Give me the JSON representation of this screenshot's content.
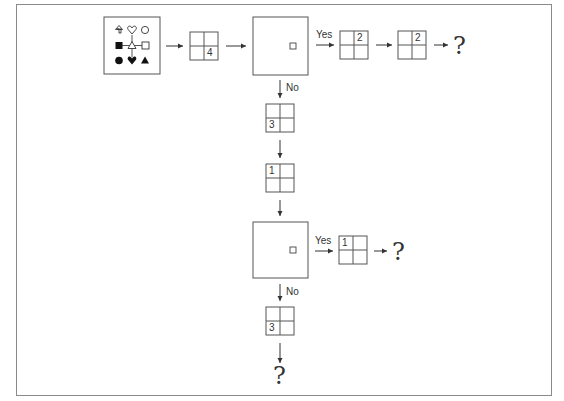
{
  "diagram": {
    "frame": {
      "x": 16,
      "y": 4,
      "w": 536,
      "h": 392
    },
    "colors": {
      "stroke": "#555555",
      "fill": "#111111",
      "frame": "#8a8a8a"
    },
    "legend_box": {
      "x": 104,
      "y": 17,
      "w": 56,
      "h": 57,
      "symbols": [
        {
          "name": "up-arrow-outline",
          "row": 0,
          "col": 0
        },
        {
          "name": "heart-outline",
          "row": 0,
          "col": 1
        },
        {
          "name": "circle-outline",
          "row": 0,
          "col": 2
        },
        {
          "name": "square-filled",
          "row": 1,
          "col": 0
        },
        {
          "name": "triangle-outline-center",
          "row": 1,
          "col": 1
        },
        {
          "name": "square-outline",
          "row": 1,
          "col": 2
        },
        {
          "name": "circle-filled",
          "row": 2,
          "col": 0
        },
        {
          "name": "heart-filled",
          "row": 2,
          "col": 1
        },
        {
          "name": "triangle-filled",
          "row": 2,
          "col": 2
        }
      ]
    },
    "big_boxes": [
      {
        "id": "decision-1",
        "x": 253,
        "y": 17,
        "w": 55,
        "h": 58
      },
      {
        "id": "decision-2",
        "x": 253,
        "y": 222,
        "w": 55,
        "h": 56
      }
    ],
    "grids": [
      {
        "id": "grid-a",
        "x": 190,
        "y": 32,
        "size": 28,
        "value": "4",
        "quadrant": "bottom-right"
      },
      {
        "id": "grid-b",
        "x": 340,
        "y": 31,
        "size": 28,
        "value": "2",
        "quadrant": "top-right"
      },
      {
        "id": "grid-c",
        "x": 398,
        "y": 31,
        "size": 28,
        "value": "2",
        "quadrant": "top-right"
      },
      {
        "id": "grid-d",
        "x": 266,
        "y": 104,
        "size": 28,
        "value": "3",
        "quadrant": "bottom-left"
      },
      {
        "id": "grid-e",
        "x": 266,
        "y": 164,
        "size": 28,
        "value": "1",
        "quadrant": "top-left"
      },
      {
        "id": "grid-f",
        "x": 339,
        "y": 236,
        "size": 28,
        "value": "1",
        "quadrant": "top-left"
      },
      {
        "id": "grid-g",
        "x": 266,
        "y": 307,
        "size": 28,
        "value": "3",
        "quadrant": "bottom-left"
      }
    ],
    "labels": {
      "yes_1": "Yes",
      "no_1": "No",
      "yes_2": "Yes",
      "no_2": "No"
    },
    "question_marks": {
      "q1": "?",
      "q2": "?",
      "q3": "?"
    }
  }
}
